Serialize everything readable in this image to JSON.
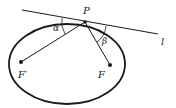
{
  "diagram": {
    "type": "ellipse-reflection-property",
    "labels": {
      "point_on_ellipse": "P",
      "tangent_line": "l",
      "focus_left": "F′",
      "focus_right": "F",
      "angle_left": "α",
      "angle_right": "β"
    },
    "colors": {
      "stroke": "#1a1a1a",
      "background": "#ffffff"
    }
  }
}
